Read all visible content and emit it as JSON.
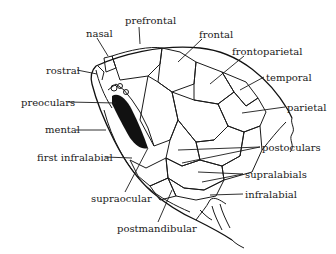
{
  "figure": {
    "labels": {
      "prefrontal": "prefrontal",
      "nasal": "nasal",
      "rostral": "rostral",
      "preoculars": "preoculars",
      "mental": "mental",
      "first_infralabial": "first infralabial",
      "supraocular": "supraocular",
      "postmandibular": "postmandibular",
      "frontal": "frontal",
      "frontoparietal": "frontoparietal",
      "temporal": "temporal",
      "parietal": "parietal",
      "postoculars": "postoculars",
      "supralabials": "supralabials",
      "infralabial": "infralabial"
    }
  }
}
